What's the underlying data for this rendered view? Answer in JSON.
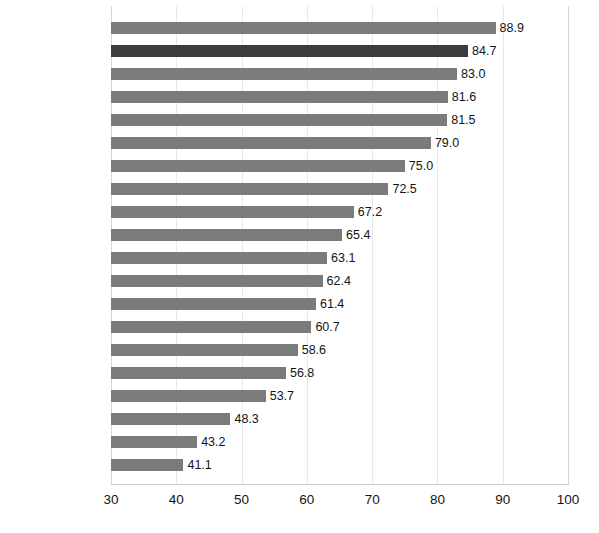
{
  "chart_data": {
    "type": "bar",
    "orientation": "horizontal",
    "title": "",
    "subtitle": "",
    "xlabel": "",
    "ylabel": "",
    "xlim": [
      30,
      100
    ],
    "xticks": [
      30,
      40,
      50,
      60,
      70,
      80,
      90,
      100
    ],
    "grid": "vertical",
    "legend": "none",
    "value_label_format": "one-decimal",
    "bar_color": "#7b7b7b",
    "emphasis_color": "#3d3d3d",
    "categories": [
      "Australia",
      "EU Top 4",
      "South Korea",
      "New Zealand",
      "Canada",
      "USA",
      "Japan",
      "Norway",
      "Mexico",
      "Israel",
      "EU Average",
      "Brazil",
      "Chile",
      "Serbia",
      "China",
      "Russia",
      "Iceland",
      "Switzerland",
      "Turkey",
      "EU Bottom 4"
    ],
    "values": [
      88.9,
      84.7,
      83.0,
      81.6,
      81.5,
      79.0,
      75.0,
      72.5,
      67.2,
      65.4,
      63.1,
      62.4,
      61.4,
      60.7,
      58.6,
      56.8,
      53.7,
      48.3,
      43.2,
      41.1
    ],
    "value_labels": [
      "88.9",
      "84.7",
      "83.0",
      "81.6",
      "81.5",
      "79.0",
      "75.0",
      "72.5",
      "67.2",
      "65.4",
      "63.1",
      "62.4",
      "61.4",
      "60.7",
      "58.6",
      "56.8",
      "53.7",
      "48.3",
      "43.2",
      "41.1"
    ],
    "emphasized": [
      false,
      true,
      false,
      false,
      false,
      false,
      false,
      false,
      false,
      false,
      false,
      false,
      false,
      false,
      false,
      false,
      false,
      false,
      false,
      false
    ],
    "xtick_labels": [
      "30",
      "40",
      "50",
      "60",
      "70",
      "80",
      "90",
      "100"
    ]
  }
}
